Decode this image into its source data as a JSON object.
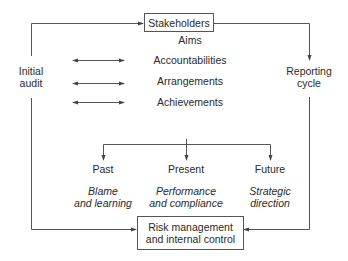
{
  "diagram": {
    "top_box": {
      "label": "Stakeholders"
    },
    "relations": [
      {
        "label": "Aims",
        "has_arrow": false
      },
      {
        "label": "Accountabilities",
        "has_arrow": true
      },
      {
        "label": "Arrangements",
        "has_arrow": true
      },
      {
        "label": "Achievements",
        "has_arrow": true
      }
    ],
    "left_node": {
      "line1": "Initial",
      "line2": "audit"
    },
    "right_node": {
      "line1": "Reporting",
      "line2": "cycle"
    },
    "time_branches": [
      {
        "title": "Past",
        "desc_line1": "Blame",
        "desc_line2": "and learning"
      },
      {
        "title": "Present",
        "desc_line1": "Performance",
        "desc_line2": "and compliance"
      },
      {
        "title": "Future",
        "desc_line1": "Strategic",
        "desc_line2": "direction"
      }
    ],
    "bottom_box": {
      "line1": "Risk management",
      "line2": "and internal control"
    },
    "colors": {
      "line": "#555555",
      "text": "#2a2a2a",
      "background": "#ffffff"
    }
  }
}
